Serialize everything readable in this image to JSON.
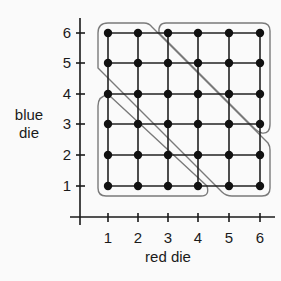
{
  "diagram": {
    "x_axis": {
      "title": "red die",
      "ticks": [
        "1",
        "2",
        "3",
        "4",
        "5",
        "6"
      ]
    },
    "y_axis": {
      "title_line1": "blue",
      "title_line2": "die",
      "ticks": [
        "1",
        "2",
        "3",
        "4",
        "5",
        "6"
      ]
    },
    "grid": {
      "rows": 6,
      "cols": 6,
      "point_color": "#111111",
      "line_color": "#222222"
    },
    "regions": [
      {
        "name": "sum-at-most-5",
        "points": [
          [
            1,
            1
          ],
          [
            1,
            2
          ],
          [
            1,
            3
          ],
          [
            1,
            4
          ],
          [
            2,
            1
          ],
          [
            2,
            2
          ],
          [
            2,
            3
          ],
          [
            3,
            1
          ],
          [
            3,
            2
          ],
          [
            4,
            1
          ]
        ]
      },
      {
        "name": "sum-6-to-8",
        "points": [
          [
            1,
            5
          ],
          [
            1,
            6
          ],
          [
            2,
            4
          ],
          [
            2,
            5
          ],
          [
            2,
            6
          ],
          [
            3,
            3
          ],
          [
            3,
            4
          ],
          [
            3,
            5
          ],
          [
            4,
            2
          ],
          [
            4,
            3
          ],
          [
            4,
            4
          ],
          [
            5,
            1
          ],
          [
            5,
            2
          ],
          [
            5,
            3
          ],
          [
            6,
            1
          ],
          [
            6,
            2
          ]
        ]
      },
      {
        "name": "sum-at-least-9",
        "points": [
          [
            3,
            6
          ],
          [
            4,
            5
          ],
          [
            4,
            6
          ],
          [
            5,
            4
          ],
          [
            5,
            5
          ],
          [
            5,
            6
          ],
          [
            6,
            3
          ],
          [
            6,
            4
          ],
          [
            6,
            5
          ],
          [
            6,
            6
          ]
        ]
      }
    ],
    "outline_color": "#7a7a7a"
  }
}
